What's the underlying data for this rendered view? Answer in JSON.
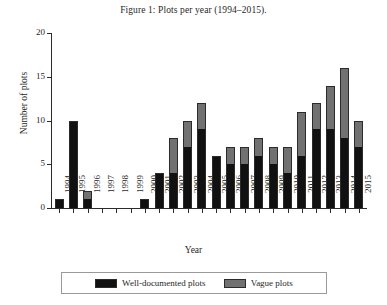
{
  "figure": {
    "caption": "Figure 1: Plots per year (1994–2015)."
  },
  "legend": {
    "position": "bottom",
    "items": [
      {
        "key": "well",
        "label": "Well-documented plots",
        "color": "#111111"
      },
      {
        "key": "vague",
        "label": "Vague plots",
        "color": "#717171"
      }
    ]
  },
  "axes": {
    "y": {
      "label": "Number of plots",
      "ticks": [
        "0",
        "5",
        "10",
        "15",
        "20"
      ],
      "min": 0,
      "max": 20
    },
    "x": {
      "label": "Year"
    }
  },
  "chart_data": {
    "type": "bar",
    "title": "Figure 1: Plots per year (1994–2015).",
    "stacked": true,
    "xlabel": "Year",
    "ylabel": "Number of plots",
    "ylim": [
      0,
      20
    ],
    "yticks": [
      0,
      5,
      10,
      15,
      20
    ],
    "grid": false,
    "legend_position": "bottom",
    "categories": [
      "1994",
      "1995",
      "1996",
      "1997",
      "1998",
      "1999",
      "2000",
      "2001",
      "2002",
      "2003",
      "2004",
      "2005",
      "2006",
      "2007",
      "2008",
      "2009",
      "2010",
      "2011",
      "2012",
      "2013",
      "2014",
      "2015"
    ],
    "series": [
      {
        "name": "Well-documented plots",
        "color": "#111111",
        "values": [
          1,
          10,
          1,
          0,
          0,
          0,
          1,
          4,
          4,
          7,
          9,
          6,
          5,
          5,
          6,
          5,
          4,
          6,
          9,
          9,
          8,
          7
        ]
      },
      {
        "name": "Vague plots",
        "color": "#717171",
        "values": [
          0,
          0,
          1,
          0,
          0,
          0,
          0,
          0,
          4,
          3,
          3,
          0,
          2,
          2,
          2,
          2,
          3,
          5,
          3,
          5,
          8,
          3
        ]
      }
    ],
    "totals": [
      1,
      10,
      2,
      0,
      0,
      0,
      1,
      4,
      8,
      10,
      12,
      6,
      7,
      7,
      8,
      7,
      7,
      11,
      12,
      14,
      16,
      10
    ]
  }
}
